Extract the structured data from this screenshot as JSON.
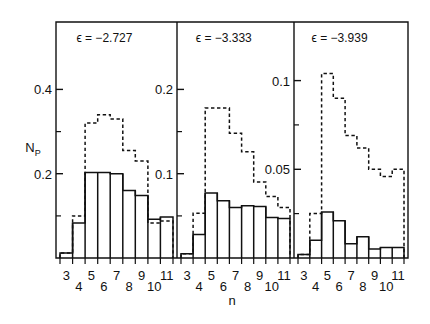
{
  "figure": {
    "y_axis_label": "N",
    "y_axis_label_sub": "P",
    "x_axis_label": "n"
  },
  "chart_data": {
    "type": "bar",
    "title": "",
    "xlabel": "n",
    "ylabel": "N_P",
    "grid": false,
    "legend": "none",
    "categories": [
      3,
      4,
      5,
      6,
      7,
      8,
      9,
      10,
      11
    ],
    "tick_labels_row1": [
      "3",
      "5",
      "7",
      "9",
      "11"
    ],
    "tick_labels_row2": [
      "4",
      "6",
      "8",
      "10"
    ],
    "panels": [
      {
        "label": "ϵ = −2.727",
        "epsilon": -2.727,
        "ytick_labels": [
          "0.4",
          "0.2"
        ],
        "ytick_values": [
          0.4,
          0.2
        ],
        "yminor_values": [
          0.3,
          0.1
        ],
        "ylim": [
          0,
          0.56
        ],
        "series": [
          {
            "name": "solid",
            "style": "solid",
            "values": [
              0.012,
              0.083,
              0.203,
              0.203,
              0.2,
              0.16,
              0.148,
              0.092,
              0.097
            ]
          },
          {
            "name": "dashed",
            "style": "dashed",
            "values": [
              0.012,
              0.1,
              0.32,
              0.34,
              0.33,
              0.255,
              0.23,
              0.083,
              0.088
            ]
          }
        ]
      },
      {
        "label": "ϵ = −3.333",
        "epsilon": -3.333,
        "ytick_labels": [
          "0.2",
          "0.1"
        ],
        "ytick_values": [
          0.2,
          0.1
        ],
        "yminor_values": [
          0.15,
          0.05
        ],
        "ylim": [
          0,
          0.28
        ],
        "series": [
          {
            "name": "solid",
            "style": "solid",
            "values": [
              0.005,
              0.028,
              0.077,
              0.068,
              0.06,
              0.062,
              0.061,
              0.048,
              0.047
            ]
          },
          {
            "name": "dashed",
            "style": "dashed",
            "values": [
              0.005,
              0.053,
              0.178,
              0.178,
              0.148,
              0.126,
              0.09,
              0.073,
              0.06
            ]
          }
        ]
      },
      {
        "label": "ϵ = −3.939",
        "epsilon": -3.939,
        "ytick_labels": [
          "0.1",
          "0.05"
        ],
        "ytick_values": [
          0.1,
          0.05
        ],
        "yminor_values": [
          0.075,
          0.025
        ],
        "ylim": [
          0,
          0.133
        ],
        "series": [
          {
            "name": "solid",
            "style": "solid",
            "values": [
              0.002,
              0.01,
              0.026,
              0.021,
              0.008,
              0.012,
              0.005,
              0.006,
              0.006
            ]
          },
          {
            "name": "dashed",
            "style": "dashed",
            "values": [
              0.002,
              0.025,
              0.104,
              0.09,
              0.069,
              0.062,
              0.05,
              0.046,
              0.05
            ]
          }
        ]
      }
    ]
  }
}
